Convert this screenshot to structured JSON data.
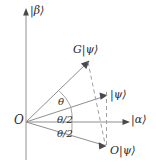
{
  "figure": {
    "background_color": "#ffffff",
    "line_color": "#8a8a8a",
    "text_color": "#2b2b2b",
    "width": 156,
    "height": 167
  },
  "axes": {
    "vertical": {
      "label": "|β⟩",
      "name": "beta-axis",
      "x": 26,
      "y_top": 12,
      "y_bottom": 160,
      "arrow": "up"
    },
    "horizontal": {
      "label": "|α⟩",
      "name": "alpha-axis",
      "y": 122,
      "x_left": 26,
      "x_right": 129,
      "arrow": "right"
    },
    "origin": {
      "label": "O",
      "x": 26,
      "y": 122
    }
  },
  "vectors": [
    {
      "name": "g-psi-vector",
      "label": "G|ψ⟩",
      "from": [
        26,
        122
      ],
      "to": [
        88,
        62
      ],
      "style": "solid",
      "arrow": true
    },
    {
      "name": "psi-vector",
      "label": "|ψ⟩",
      "from": [
        26,
        122
      ],
      "to": [
        106,
        96
      ],
      "style": "solid",
      "arrow": true
    },
    {
      "name": "o-psi-vector",
      "label": "O|ψ⟩",
      "from": [
        26,
        122
      ],
      "to": [
        105,
        146
      ],
      "style": "solid",
      "arrow": true
    }
  ],
  "dashed_lines": [
    {
      "name": "gpsi-to-opsi-dashed",
      "from": [
        88,
        62
      ],
      "to": [
        105,
        146
      ]
    },
    {
      "name": "psi-vertical-dashed",
      "from": [
        106,
        96
      ],
      "to": [
        106,
        146
      ]
    }
  ],
  "angles": [
    {
      "name": "theta-angle",
      "label": "θ",
      "from_vector": "psi-vector",
      "to_vector": "g-psi-vector",
      "arc_radius": 46
    },
    {
      "name": "theta-half-upper-angle",
      "label": "θ/2",
      "from_vector": "alpha-axis",
      "to_vector": "psi-vector",
      "arc_radius": 46
    },
    {
      "name": "theta-half-lower-angle",
      "label": "θ/2",
      "from_vector": "o-psi-vector",
      "to_vector": "alpha-axis",
      "arc_radius": 46
    }
  ]
}
